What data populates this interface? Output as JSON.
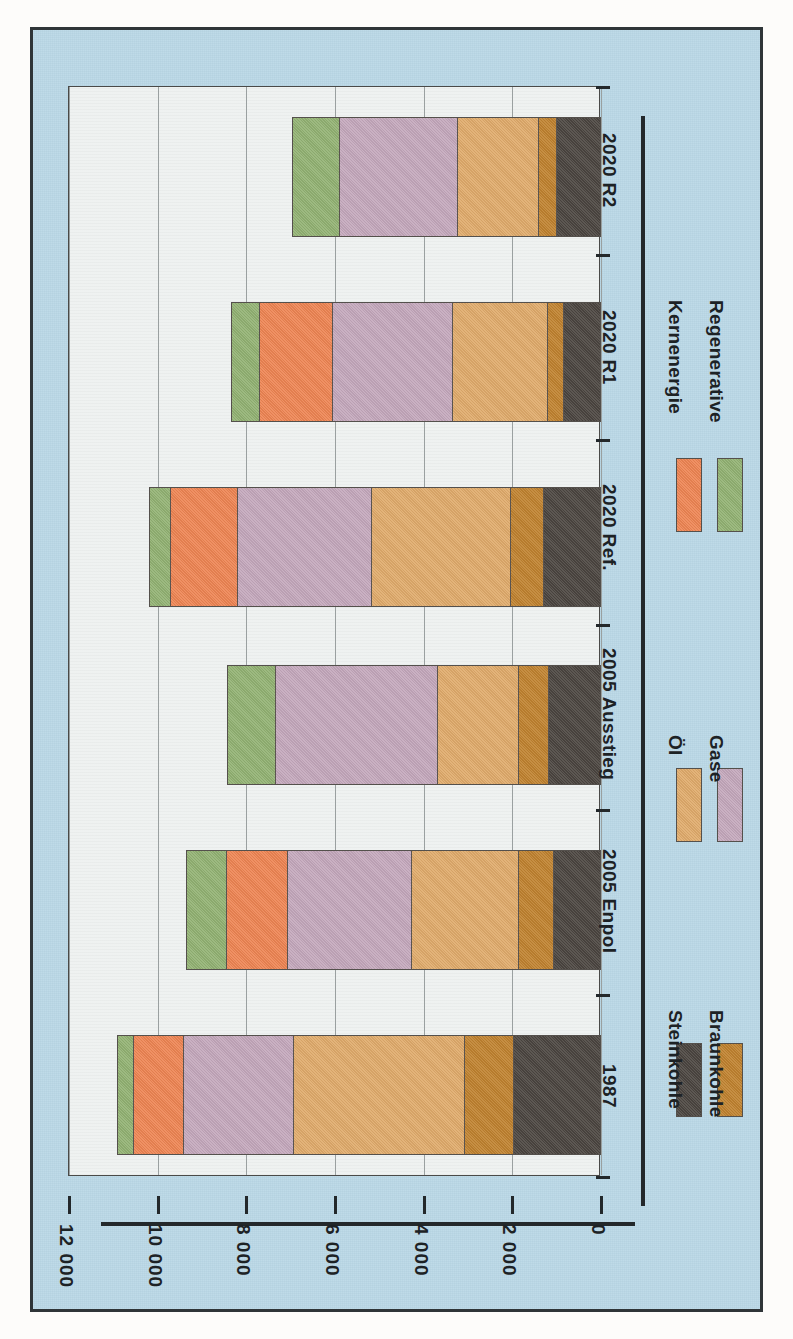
{
  "chart_data": {
    "type": "bar",
    "orientation": "horizontal-rotated",
    "title": "",
    "xlabel": "",
    "ylabel": "",
    "categories": [
      "1987",
      "2005 Enpol",
      "2005 Ausstieg",
      "2020 Ref.",
      "2020 R1",
      "2020 R2"
    ],
    "tick_labels": [
      "12 000",
      "10 000",
      "8 000",
      "6 000",
      "4 000",
      "2 000",
      "0"
    ],
    "tick_values": [
      12000,
      10000,
      8000,
      6000,
      4000,
      2000,
      0
    ],
    "ylim": [
      0,
      12000
    ],
    "grid": true,
    "legend_position": "right",
    "series": [
      {
        "name": "Steinkohle",
        "color": "#4b4540",
        "values": [
          1954,
          1035,
          1149,
          1264,
          805,
          966
        ]
      },
      {
        "name": "Braunkohle",
        "color": "#c0822f",
        "values": [
          1103,
          805,
          690,
          759,
          368,
          414
        ]
      },
      {
        "name": "Öl",
        "color": "#e0ab6b",
        "values": [
          3885,
          2414,
          1839,
          3149,
          2161,
          1839
        ]
      },
      {
        "name": "Gase",
        "color": "#c4a8bc",
        "values": [
          2483,
          2828,
          3678,
          3034,
          2713,
          2690
        ]
      },
      {
        "name": "Kernenergie",
        "color": "#ee8553",
        "values": [
          1126,
          1379,
          0,
          1517,
          1655,
          0
        ]
      },
      {
        "name": "Regenerative",
        "color": "#92b273",
        "values": [
          368,
          897,
          1080,
          483,
          644,
          1057
        ]
      }
    ],
    "totals": [
      10919,
      9358,
      8436,
      10206,
      8346,
      6966
    ]
  },
  "legend": {
    "items": [
      {
        "label": "Steinkohle",
        "color": "#4b4540"
      },
      {
        "label": "Braunkohle",
        "color": "#c0822f"
      },
      {
        "label": "Öl",
        "color": "#e0ab6b"
      },
      {
        "label": "Gase",
        "color": "#c4a8bc"
      },
      {
        "label": "Kernenergie",
        "color": "#ee8553"
      },
      {
        "label": "Regenerative",
        "color": "#92b273"
      }
    ]
  },
  "colors": {
    "plate_background": "#b9d7e6",
    "panel_background": "#eef1f0",
    "axis": "#23282b",
    "gridline": "#9aa0a0",
    "border": "#2f3538"
  }
}
